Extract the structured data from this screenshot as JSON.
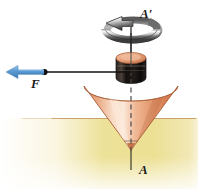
{
  "figure": {
    "labels": {
      "axis_top": "A′",
      "axis_bottom": "A",
      "force": "F"
    },
    "icons": {
      "spin_arrow": "rotation-arrow-icon",
      "force_arrow": "force-arrow-icon",
      "application_point": "force-application-point-icon"
    },
    "colors": {
      "background": "#ffffff",
      "cone_light": "#f7d9c4",
      "cone_mid": "#e8a882",
      "cone_dark": "#cf7f57",
      "cone_outline": "#a85c37",
      "cylinder_band": "#1b1b1b",
      "cylinder_top": "#e8a882",
      "ground_sand": "#efe09a",
      "ground_line": "#b98a55",
      "force_arrow": "#5b9bd5",
      "axis_line": "#1a1a1a",
      "spin_arrow_light": "#f2f2f2",
      "spin_arrow_dark": "#4a4a4a",
      "label_text": "#1a1a1a"
    },
    "geometry": {
      "axis_x": 131,
      "axis_top_y": 18,
      "axis_bottom_y": 170,
      "cone_tip_y": 150,
      "cone_rim_y": 86,
      "ground_y": 118,
      "force_arrow_tip_x": 8,
      "force_arrow_y": 72,
      "force_point_x": 44
    }
  }
}
